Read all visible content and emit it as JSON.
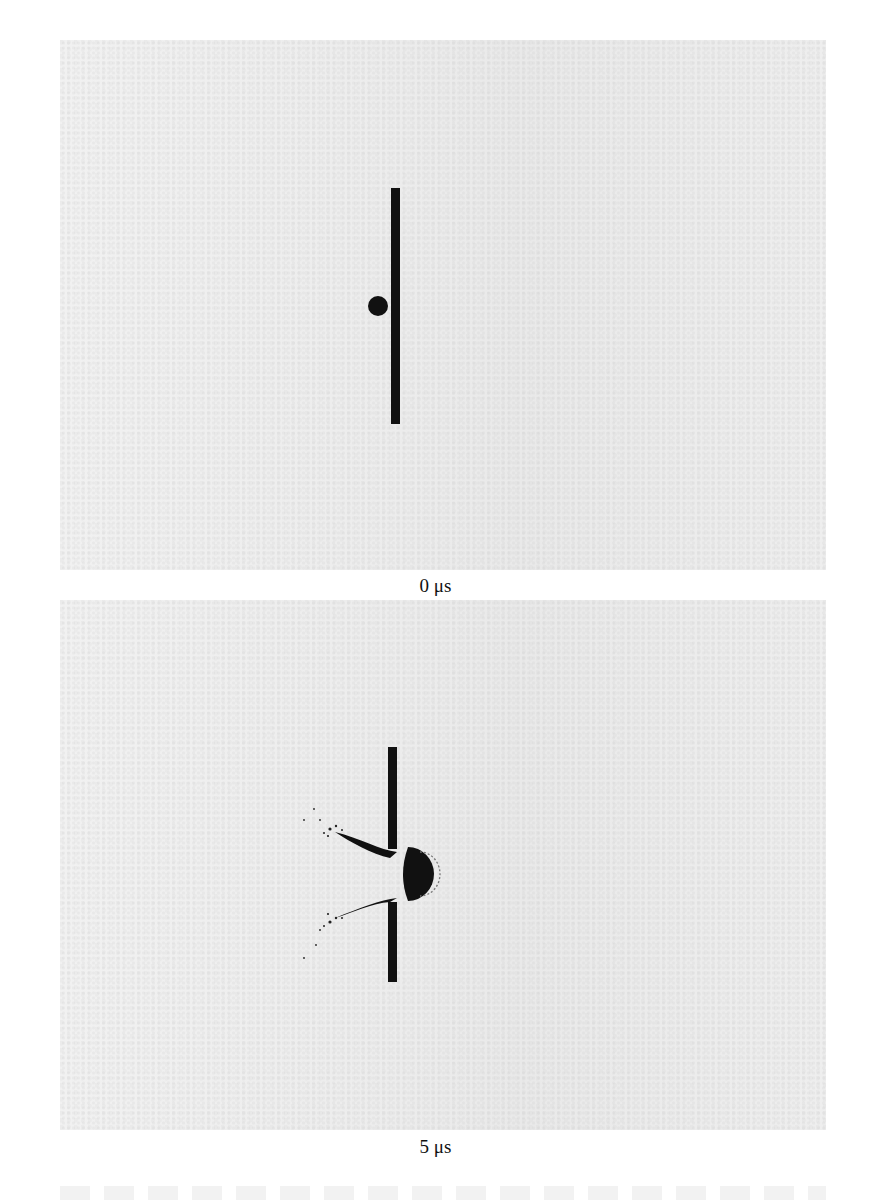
{
  "figure": {
    "panels": [
      {
        "id": "frame-0",
        "time_label": "0 μs",
        "description": "Spherical projectile approaching a thin vertical plate"
      },
      {
        "id": "frame-1",
        "time_label": "5 μs",
        "description": "Projectile penetrating the plate, with debris cloud and ejecta spray on the impact side"
      }
    ],
    "colors": {
      "panel_background": "#efefef",
      "ink": "#111111",
      "page": "#ffffff"
    }
  }
}
